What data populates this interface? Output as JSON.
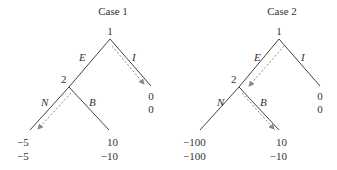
{
  "cases": [
    {
      "title": "Case 1",
      "root_label": "1",
      "node2_label": "2",
      "edges": {
        "E": "E",
        "I": "I",
        "N": "N",
        "B": "B"
      },
      "payoffs": {
        "I": [
          "0",
          "0"
        ],
        "N": [
          "−5",
          "−5"
        ],
        "B": [
          "10",
          "−10"
        ]
      },
      "equilibrium_path": [
        "I",
        "N"
      ]
    },
    {
      "title": "Case 2",
      "root_label": "1",
      "node2_label": "2",
      "edges": {
        "E": "E",
        "I": "I",
        "N": "N",
        "B": "B"
      },
      "payoffs": {
        "I": [
          "0",
          "0"
        ],
        "N": [
          "−100",
          "−100"
        ],
        "B": [
          "10",
          "−10"
        ]
      },
      "equilibrium_path": [
        "E",
        "B"
      ]
    }
  ],
  "colors": {
    "line": "#444444",
    "arrow": "#888888"
  }
}
